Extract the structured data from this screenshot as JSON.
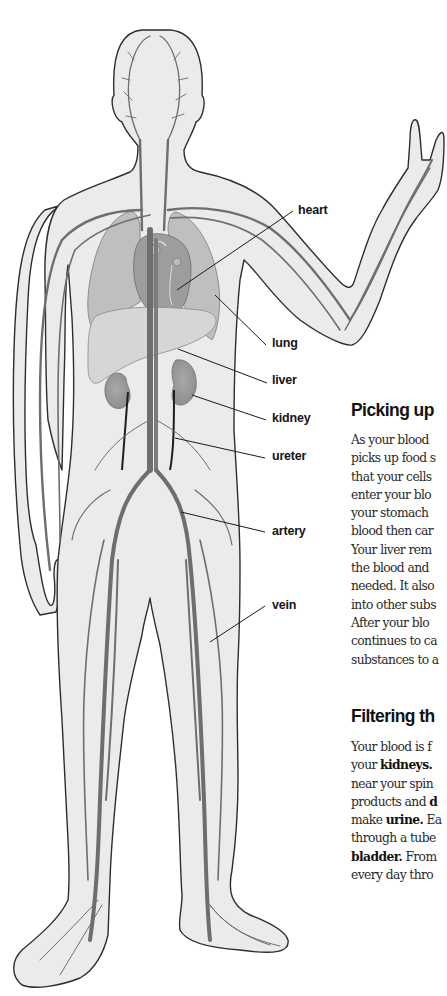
{
  "figure": {
    "labels": [
      {
        "id": "heart",
        "text": "heart"
      },
      {
        "id": "lung",
        "text": "lung"
      },
      {
        "id": "liver",
        "text": "liver"
      },
      {
        "id": "kidney",
        "text": "kidney"
      },
      {
        "id": "ureter",
        "text": "ureter"
      },
      {
        "id": "artery",
        "text": "artery"
      },
      {
        "id": "vein",
        "text": "vein"
      }
    ]
  },
  "sections": [
    {
      "heading": "Picking up",
      "lines": [
        "As your blood",
        "picks up food s",
        "that your cells",
        "enter your blo",
        "your stomach",
        "blood then car",
        "Your liver rem",
        "the blood and",
        "needed. It also",
        "into other subs",
        "After your blo",
        "continues to ca",
        "substances to a"
      ]
    },
    {
      "heading": "Filtering th",
      "lines": [
        {
          "pre": "Your blood is f",
          "bold": "",
          "post": ""
        },
        {
          "pre": "your ",
          "bold": "kidneys.",
          "post": ""
        },
        {
          "pre": "near your spin",
          "bold": "",
          "post": ""
        },
        {
          "pre": "products and ",
          "bold": "d",
          "post": ""
        },
        {
          "pre": "make ",
          "bold": "urine.",
          "post": " Ea"
        },
        {
          "pre": "through a tube",
          "bold": "",
          "post": ""
        },
        {
          "pre": "",
          "bold": "bladder.",
          "post": " From"
        },
        {
          "pre": "every day thro",
          "bold": "",
          "post": ""
        }
      ]
    }
  ],
  "colors": {
    "skin": "#ebebeb",
    "outline": "#2e2e2e",
    "vessel": "#6e6e6e",
    "organ": "#b9b9b9",
    "organ_dark": "#a2a2a2",
    "ureter": "#1e1e1e",
    "leader": "#1a1a1a"
  }
}
